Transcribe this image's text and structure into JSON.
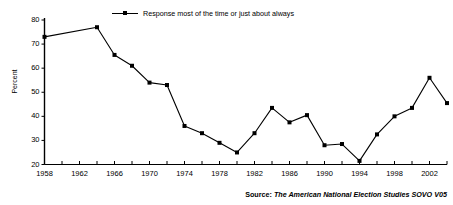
{
  "chart_data": {
    "type": "line",
    "title": "",
    "xlabel": "",
    "ylabel": "Percent",
    "ylim": [
      20,
      80
    ],
    "xlim": [
      1958,
      2004
    ],
    "grid": false,
    "legend_position": "top-center",
    "y_ticks": [
      20,
      30,
      40,
      50,
      60,
      70,
      80
    ],
    "x_ticks": [
      1958,
      1960,
      1962,
      1964,
      1966,
      1968,
      1970,
      1972,
      1974,
      1976,
      1978,
      1980,
      1982,
      1984,
      1986,
      1988,
      1990,
      1992,
      1994,
      1996,
      1998,
      2000,
      2002,
      2004
    ],
    "x_tick_labels": [
      "1958",
      "",
      "1962",
      "",
      "1966",
      "",
      "1970",
      "",
      "1974",
      "",
      "1978",
      "",
      "1982",
      "",
      "1986",
      "",
      "1990",
      "",
      "1994",
      "",
      "1998",
      "",
      "2002",
      ""
    ],
    "series": [
      {
        "name": "Response most of the time or just about always",
        "color": "#000000",
        "marker": "square",
        "x": [
          1958,
          1964,
          1966,
          1968,
          1970,
          1972,
          1974,
          1976,
          1978,
          1980,
          1982,
          1984,
          1986,
          1988,
          1990,
          1992,
          1994,
          1996,
          1998,
          2000,
          2002,
          2004
        ],
        "values": [
          73,
          77,
          65.5,
          61,
          54,
          53,
          36,
          33,
          29,
          25,
          33,
          43.5,
          37.5,
          40.5,
          28,
          28.5,
          21.5,
          32.5,
          40,
          43.5,
          56,
          45.5
        ]
      }
    ],
    "annotations": []
  },
  "legend": {
    "label": "Response most of the time or just about always"
  },
  "axes": {
    "y_title": "Percent",
    "y_tick_labels": [
      "80",
      "70",
      "60",
      "50",
      "40",
      "30",
      "20"
    ],
    "x_tick_labels_visible": [
      "1958",
      "1962",
      "1966",
      "1970",
      "1974",
      "1978",
      "1982",
      "1986",
      "1990",
      "1994",
      "1998",
      "2002"
    ]
  },
  "source": {
    "prefix": "Source:",
    "text": "The American National Election Studies SOVO V05",
    "full": "Source: The American National Election Studies SOVO V05"
  },
  "colors": {
    "line": "#000000",
    "axis": "#000000",
    "background": "#ffffff"
  }
}
